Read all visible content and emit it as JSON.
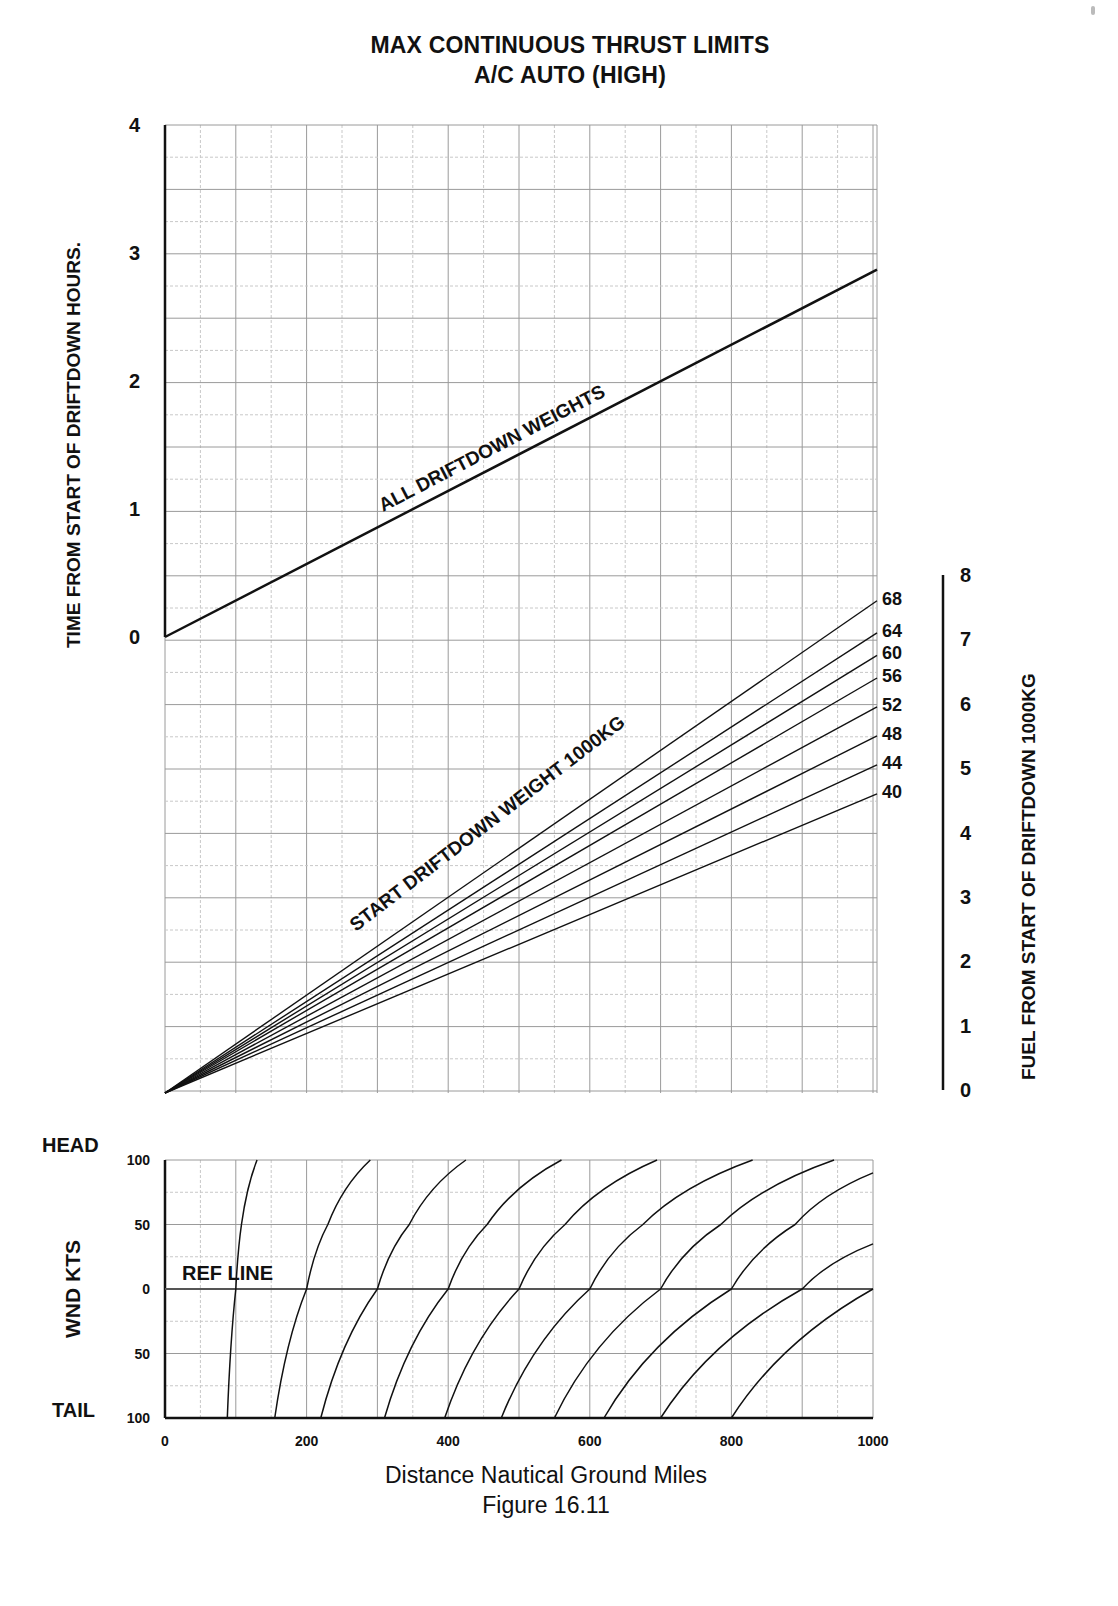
{
  "header": {
    "title_line1": "MAX CONTINUOUS THRUST LIMITS",
    "title_line2": "A/C AUTO (HIGH)"
  },
  "footer": {
    "xlabel": "Distance Nautical Ground Miles",
    "figure": "Figure 16.11"
  },
  "colors": {
    "line": "#111111",
    "grid_major": "#9a9a9a",
    "grid_minor": "#c8c8c8",
    "background": "#ffffff"
  },
  "chart_data": [
    {
      "type": "line",
      "panel": "time",
      "title": "MAX CONTINUOUS THRUST LIMITS A/C AUTO (HIGH)",
      "xlabel": "Distance Nautical Ground Miles",
      "ylabel": "TIME FROM START OF DRIFTDOWN HOURS.",
      "xlim": [
        0,
        1000
      ],
      "ylim": [
        0,
        4
      ],
      "yticks": [
        "0",
        "1",
        "2",
        "3",
        "4"
      ],
      "grid": true,
      "series": [
        {
          "name": "ALL DRIFTDOWN WEIGHTS",
          "x": [
            0,
            1000
          ],
          "y": [
            0,
            2.87
          ]
        }
      ],
      "annotations": [
        "ALL DRIFTDOWN WEIGHTS"
      ]
    },
    {
      "type": "line",
      "panel": "fuel",
      "xlabel": "Distance Nautical Ground Miles",
      "ylabel": "FUEL FROM START OF DRIFTDOWN 1000KG",
      "xlim": [
        0,
        1000
      ],
      "ylim": [
        0,
        8
      ],
      "yticks": [
        "0",
        "1",
        "2",
        "3",
        "4",
        "5",
        "6",
        "7",
        "8"
      ],
      "grid": true,
      "legend_title": "START DRIFTDOWN WEIGHT 1000KG",
      "series": [
        {
          "name": "68",
          "x": [
            0,
            1000
          ],
          "y": [
            0,
            7.6
          ]
        },
        {
          "name": "64",
          "x": [
            0,
            1000
          ],
          "y": [
            0,
            7.1
          ]
        },
        {
          "name": "60",
          "x": [
            0,
            1000
          ],
          "y": [
            0,
            6.75
          ]
        },
        {
          "name": "56",
          "x": [
            0,
            1000
          ],
          "y": [
            0,
            6.4
          ]
        },
        {
          "name": "52",
          "x": [
            0,
            1000
          ],
          "y": [
            0,
            5.95
          ]
        },
        {
          "name": "48",
          "x": [
            0,
            1000
          ],
          "y": [
            0,
            5.5
          ]
        },
        {
          "name": "44",
          "x": [
            0,
            1000
          ],
          "y": [
            0,
            5.05
          ]
        },
        {
          "name": "40",
          "x": [
            0,
            1000
          ],
          "y": [
            0,
            4.6
          ]
        }
      ]
    },
    {
      "type": "line",
      "panel": "wind",
      "xlabel": "Distance Nautical Ground Miles",
      "ylabel": "WND KTS",
      "xlim": [
        0,
        1000
      ],
      "ylim": [
        -100,
        100
      ],
      "xticks": [
        "0",
        "200",
        "400",
        "600",
        "800",
        "1000"
      ],
      "yticks": [
        "100",
        "50",
        "0",
        "50",
        "100"
      ],
      "y_extremes": {
        "top": "HEAD",
        "bottom": "TAIL"
      },
      "reference_line": {
        "label": "REF LINE",
        "y": 0
      },
      "grid": true,
      "series": [
        {
          "name": "100",
          "points": [
            [
              88,
              -100
            ],
            [
              100,
              0
            ],
            [
              108,
              50
            ],
            [
              130,
              100
            ]
          ]
        },
        {
          "name": "200",
          "points": [
            [
              155,
              -100
            ],
            [
              200,
              0
            ],
            [
              230,
              50
            ],
            [
              290,
              100
            ]
          ]
        },
        {
          "name": "300",
          "points": [
            [
              220,
              -100
            ],
            [
              300,
              0
            ],
            [
              345,
              50
            ],
            [
              425,
              100
            ]
          ]
        },
        {
          "name": "400",
          "points": [
            [
              310,
              -100
            ],
            [
              400,
              0
            ],
            [
              455,
              50
            ],
            [
              560,
              100
            ]
          ]
        },
        {
          "name": "500",
          "points": [
            [
              395,
              -100
            ],
            [
              500,
              0
            ],
            [
              565,
              50
            ],
            [
              695,
              100
            ]
          ]
        },
        {
          "name": "600",
          "points": [
            [
              475,
              -100
            ],
            [
              600,
              0
            ],
            [
              675,
              50
            ],
            [
              830,
              100
            ]
          ]
        },
        {
          "name": "700",
          "points": [
            [
              550,
              -100
            ],
            [
              700,
              0
            ],
            [
              785,
              50
            ],
            [
              945,
              100
            ]
          ]
        },
        {
          "name": "800",
          "points": [
            [
              620,
              -100
            ],
            [
              800,
              0
            ],
            [
              890,
              50
            ],
            [
              1000,
              90
            ]
          ]
        },
        {
          "name": "900",
          "points": [
            [
              700,
              -100
            ],
            [
              900,
              0
            ],
            [
              1000,
              35
            ]
          ]
        },
        {
          "name": "1000",
          "points": [
            [
              800,
              -100
            ],
            [
              1000,
              0
            ]
          ]
        }
      ]
    }
  ],
  "axes": {
    "time": {
      "label": "TIME FROM START OF DRIFTDOWN HOURS.",
      "ticks": [
        "0",
        "1",
        "2",
        "3",
        "4"
      ]
    },
    "fuel": {
      "label": "FUEL FROM START OF DRIFTDOWN 1000KG",
      "ticks": [
        "0",
        "1",
        "2",
        "3",
        "4",
        "5",
        "6",
        "7",
        "8"
      ]
    },
    "wind": {
      "label": "WND KTS",
      "ticks": [
        "100",
        "50",
        "0",
        "50",
        "100"
      ],
      "head": "HEAD",
      "tail": "TAIL",
      "ref": "REF LINE"
    },
    "distance": {
      "ticks": [
        "0",
        "200",
        "400",
        "600",
        "800",
        "1000"
      ]
    }
  },
  "annotations": {
    "all_weights": "ALL DRIFTDOWN WEIGHTS",
    "start_weight": "START DRIFTDOWN WEIGHT 1000KG"
  }
}
